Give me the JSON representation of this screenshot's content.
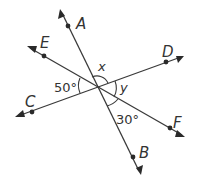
{
  "diagram": {
    "points": {
      "A": "A",
      "B": "B",
      "C": "C",
      "D": "D",
      "E": "E",
      "F": "F"
    },
    "angles": {
      "angle_CE": "50°",
      "angle_x": "x",
      "angle_y": "y",
      "angle_BF": "30°"
    },
    "lines": [
      "AB",
      "CD",
      "EF"
    ],
    "colors": {
      "stroke": "#3a3a3a",
      "background": "#ffffff"
    }
  }
}
